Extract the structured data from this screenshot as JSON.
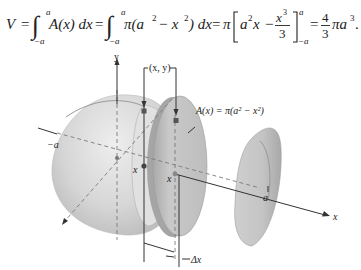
{
  "formula": {
    "lhs": "V",
    "eq1": "=",
    "int1_upper": "a",
    "int1_lower": "−a",
    "int1_body": "A(x) dx",
    "eq2": "=",
    "int2_upper": "a",
    "int2_lower": "−a",
    "int2_body_pi": "π(a",
    "int2_body_sq1": "2",
    "int2_body_minus": " − x",
    "int2_body_sq2": "2",
    "int2_body_end": ") dx",
    "eq3": "=",
    "pi": "π",
    "bracket_a2x": "a",
    "bracket_a2x_sup": "2",
    "bracket_a2x_x": "x",
    "bracket_minus": "−",
    "frac_num": "x",
    "frac_num_sup": "3",
    "frac_den": "3",
    "eval_upper": "a",
    "eval_lower": "−a",
    "eq4": "=",
    "result_num": "4",
    "result_den": "3",
    "result_tail": "πa",
    "result_sup": "3",
    "period": "."
  },
  "figure": {
    "labels": {
      "y_axis": "y",
      "x_axis": "x",
      "point_xy": "(x, y)",
      "area_formula": "A(x) = π(a² − x²)",
      "neg_a": "−a",
      "pos_a": "a",
      "x_mark_1": "x",
      "x_mark_2": "x",
      "delta_x": "Δx"
    },
    "colors": {
      "sphere_fill": "#d4d4d4",
      "slab_fill": "#bdbdbd",
      "cap_fill": "#c2c2c2",
      "axis": "#333333",
      "dashed": "#7a7a7a"
    }
  }
}
